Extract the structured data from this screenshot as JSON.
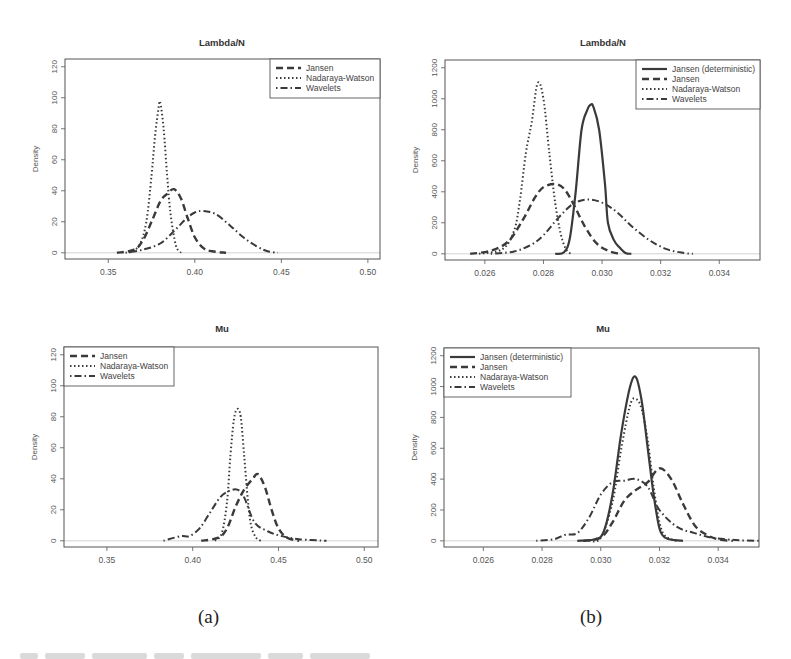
{
  "figure": {
    "captions": [
      "(a)",
      "(b)"
    ]
  },
  "chart_data": [
    {
      "id": "a-top",
      "type": "line",
      "title": "Lambda/N",
      "xlabel": "",
      "ylabel": "Density",
      "xlim": [
        0.325,
        0.507
      ],
      "ylim": [
        -4,
        125
      ],
      "xticks": [
        0.35,
        0.4,
        0.45,
        0.5
      ],
      "xtick_labels": [
        "0.35",
        "0.40",
        "0.45",
        "0.50"
      ],
      "yticks": [
        0,
        20,
        40,
        60,
        80,
        100,
        120
      ],
      "ytick_labels": [
        "0",
        "20",
        "40",
        "60",
        "80",
        "100",
        "120"
      ],
      "legend_position": "topright",
      "grid": false,
      "series": [
        {
          "name": "Jansen",
          "style": "dashed",
          "x": [
            0.355,
            0.365,
            0.37,
            0.375,
            0.38,
            0.384,
            0.388,
            0.392,
            0.396,
            0.4,
            0.405,
            0.41,
            0.418
          ],
          "y": [
            0,
            2,
            8,
            20,
            33,
            38,
            41,
            35,
            22,
            10,
            3,
            1,
            0
          ]
        },
        {
          "name": "Nadaraya-Watson",
          "style": "dotted",
          "x": [
            0.362,
            0.368,
            0.372,
            0.375,
            0.377,
            0.379,
            0.38,
            0.382,
            0.384,
            0.386,
            0.389,
            0.392
          ],
          "y": [
            0,
            5,
            20,
            50,
            75,
            93,
            97,
            80,
            50,
            25,
            5,
            0
          ]
        },
        {
          "name": "Wavelets",
          "style": "dotdash",
          "x": [
            0.36,
            0.37,
            0.38,
            0.388,
            0.395,
            0.4,
            0.405,
            0.412,
            0.42,
            0.428,
            0.436,
            0.442,
            0.448
          ],
          "y": [
            0,
            2,
            6,
            14,
            22,
            26,
            27,
            25,
            18,
            10,
            4,
            1,
            0
          ]
        }
      ]
    },
    {
      "id": "b-top",
      "type": "line",
      "title": "Lambda/N",
      "xlabel": "",
      "ylabel": "Density",
      "xlim": [
        0.02464,
        0.03539
      ],
      "ylim": [
        -40,
        1250
      ],
      "xticks": [
        0.026,
        0.028,
        0.03,
        0.032,
        0.034
      ],
      "xtick_labels": [
        "0.026",
        "0.028",
        "0.030",
        "0.032",
        "0.034"
      ],
      "yticks": [
        0,
        200,
        400,
        600,
        800,
        1000,
        1200
      ],
      "ytick_labels": [
        "0",
        "200",
        "400",
        "600",
        "800",
        "1000",
        "1200"
      ],
      "legend_position": "topright",
      "grid": false,
      "series": [
        {
          "name": "Jansen (deterministic)",
          "style": "solid",
          "x": [
            0.0284,
            0.0287,
            0.0289,
            0.0291,
            0.0293,
            0.0295,
            0.0296,
            0.0297,
            0.0299,
            0.0301,
            0.0302,
            0.0304,
            0.0306,
            0.0308,
            0.031
          ],
          "y": [
            0,
            10,
            100,
            400,
            800,
            930,
            960,
            950,
            800,
            450,
            200,
            90,
            40,
            5,
            0
          ]
        },
        {
          "name": "Jansen",
          "style": "dashed",
          "x": [
            0.0255,
            0.0262,
            0.0268,
            0.0273,
            0.0277,
            0.028,
            0.0284,
            0.0287,
            0.029,
            0.0294,
            0.0298,
            0.0302,
            0.0306
          ],
          "y": [
            0,
            20,
            80,
            220,
            360,
            430,
            450,
            420,
            330,
            180,
            70,
            20,
            0
          ]
        },
        {
          "name": "Nadaraya-Watson",
          "style": "dotted",
          "x": [
            0.0258,
            0.0266,
            0.027,
            0.0272,
            0.0274,
            0.0276,
            0.0278,
            0.028,
            0.0282,
            0.0284,
            0.0286,
            0.0288,
            0.029
          ],
          "y": [
            0,
            30,
            150,
            350,
            650,
            850,
            1100,
            1000,
            650,
            330,
            120,
            20,
            0
          ]
        },
        {
          "name": "Wavelets",
          "style": "dotdash",
          "x": [
            0.0262,
            0.027,
            0.0276,
            0.028,
            0.0285,
            0.029,
            0.0295,
            0.03,
            0.0305,
            0.031,
            0.0316,
            0.0322,
            0.0328,
            0.0331
          ],
          "y": [
            0,
            15,
            60,
            120,
            230,
            320,
            350,
            330,
            270,
            180,
            90,
            30,
            5,
            0
          ]
        }
      ]
    },
    {
      "id": "a-bottom",
      "type": "line",
      "title": "Mu",
      "xlabel": "",
      "ylabel": "Density",
      "xlim": [
        0.325,
        0.508
      ],
      "ylim": [
        -4,
        125
      ],
      "xticks": [
        0.35,
        0.4,
        0.45,
        0.5
      ],
      "xtick_labels": [
        "0.35",
        "0.40",
        "0.45",
        "0.50"
      ],
      "yticks": [
        0,
        20,
        40,
        60,
        80,
        100,
        120
      ],
      "ytick_labels": [
        "0",
        "20",
        "40",
        "60",
        "80",
        "100",
        "120"
      ],
      "legend_position": "topleft",
      "grid": false,
      "series": [
        {
          "name": "Jansen",
          "style": "dashed",
          "x": [
            0.405,
            0.415,
            0.42,
            0.425,
            0.43,
            0.435,
            0.438,
            0.442,
            0.446,
            0.45,
            0.455,
            0.462
          ],
          "y": [
            0,
            2,
            8,
            22,
            33,
            40,
            43,
            35,
            20,
            8,
            2,
            0
          ]
        },
        {
          "name": "Nadaraya-Watson",
          "style": "dotted",
          "x": [
            0.413,
            0.417,
            0.42,
            0.422,
            0.424,
            0.426,
            0.428,
            0.43,
            0.432,
            0.434,
            0.437,
            0.44
          ],
          "y": [
            0,
            5,
            25,
            55,
            78,
            85,
            80,
            55,
            28,
            10,
            2,
            0
          ]
        },
        {
          "name": "Wavelets",
          "style": "dotdash",
          "x": [
            0.383,
            0.393,
            0.398,
            0.404,
            0.41,
            0.416,
            0.421,
            0.426,
            0.43,
            0.436,
            0.444,
            0.452,
            0.462,
            0.478
          ],
          "y": [
            0,
            3,
            3,
            8,
            18,
            28,
            32,
            33,
            28,
            12,
            6,
            3,
            1,
            0
          ]
        }
      ]
    },
    {
      "id": "b-bottom",
      "type": "line",
      "title": "Mu",
      "xlabel": "",
      "ylabel": "Density",
      "xlim": [
        0.02466,
        0.03539
      ],
      "ylim": [
        -40,
        1250
      ],
      "xticks": [
        0.026,
        0.028,
        0.03,
        0.032,
        0.034
      ],
      "xtick_labels": [
        "0.026",
        "0.028",
        "0.030",
        "0.032",
        "0.034"
      ],
      "yticks": [
        0,
        200,
        400,
        600,
        800,
        1000,
        1200
      ],
      "ytick_labels": [
        "0",
        "200",
        "400",
        "600",
        "800",
        "1000",
        "1200"
      ],
      "legend_position": "topleft",
      "grid": false,
      "series": [
        {
          "name": "Jansen (deterministic)",
          "style": "solid",
          "x": [
            0.0292,
            0.0298,
            0.0301,
            0.0304,
            0.0307,
            0.031,
            0.0312,
            0.0314,
            0.0316,
            0.0318,
            0.032,
            0.0322,
            0.0325,
            0.0328
          ],
          "y": [
            0,
            10,
            60,
            300,
            700,
            1000,
            1060,
            900,
            600,
            300,
            80,
            20,
            5,
            0
          ]
        },
        {
          "name": "Jansen",
          "style": "dashed",
          "x": [
            0.0294,
            0.03,
            0.0304,
            0.0308,
            0.0312,
            0.0316,
            0.032,
            0.0324,
            0.0328,
            0.0332,
            0.0336,
            0.034,
            0.0345
          ],
          "y": [
            0,
            20,
            120,
            260,
            330,
            380,
            470,
            400,
            240,
            100,
            40,
            10,
            0
          ]
        },
        {
          "name": "Nadaraya-Watson",
          "style": "dotted",
          "x": [
            0.0296,
            0.03,
            0.0304,
            0.0307,
            0.031,
            0.0312,
            0.0314,
            0.0316,
            0.0318,
            0.032,
            0.0322,
            0.0326
          ],
          "y": [
            0,
            20,
            250,
            600,
            880,
            920,
            850,
            650,
            350,
            120,
            30,
            0
          ]
        },
        {
          "name": "Wavelets",
          "style": "dotdash",
          "x": [
            0.0278,
            0.0284,
            0.0288,
            0.0292,
            0.0296,
            0.03,
            0.0304,
            0.0308,
            0.0312,
            0.0316,
            0.032,
            0.0326,
            0.0332,
            0.0338,
            0.0346,
            0.0354
          ],
          "y": [
            0,
            10,
            40,
            50,
            150,
            300,
            380,
            390,
            400,
            350,
            200,
            90,
            50,
            20,
            5,
            0
          ]
        }
      ]
    }
  ]
}
